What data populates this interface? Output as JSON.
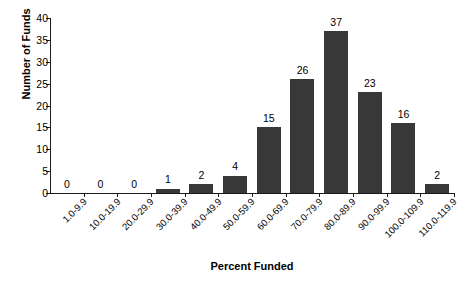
{
  "chart_data": {
    "type": "bar",
    "title": "",
    "xlabel": "Percent Funded",
    "ylabel": "Number of Funds",
    "categories": [
      "1.0-9.9",
      "10.0-19.9",
      "20.0-29.9",
      "30.0-39.9",
      "40.0-49.9",
      "50.0-59.9",
      "60.0-69.9",
      "70.0-79.9",
      "80.0-89.9",
      "90.0-99.9",
      "100.0-109.9",
      "110.0-119.9"
    ],
    "values": [
      0,
      0,
      0,
      1,
      2,
      4,
      15,
      26,
      37,
      23,
      16,
      2
    ],
    "ylim": [
      0,
      40
    ],
    "ytick_values": [
      0,
      5,
      10,
      15,
      20,
      25,
      30,
      35,
      40
    ],
    "ytick_labels": [
      "0",
      "5",
      "10",
      "15",
      "20",
      "25",
      "30",
      "35",
      "40"
    ],
    "grid": false,
    "legend": false,
    "bar_color": "#383838",
    "axis_color": "#1a1a1a",
    "data_labels": [
      "0",
      "0",
      "0",
      "1",
      "2",
      "4",
      "15",
      "26",
      "37",
      "23",
      "16",
      "2"
    ]
  }
}
